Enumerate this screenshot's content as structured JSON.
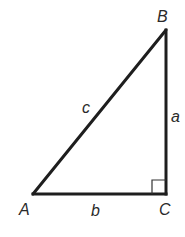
{
  "diagram": {
    "type": "right-triangle",
    "colors": {
      "stroke": "#1e1e1e",
      "label": "#2a2a2a",
      "background": "#ffffff"
    },
    "vertices": {
      "A": {
        "label": "A",
        "x": 33,
        "y": 194
      },
      "B": {
        "label": "B",
        "x": 166,
        "y": 30
      },
      "C": {
        "label": "C",
        "x": 166,
        "y": 194
      }
    },
    "sides": {
      "a": {
        "label": "a",
        "from": "B",
        "to": "C"
      },
      "b": {
        "label": "b",
        "from": "A",
        "to": "C"
      },
      "c": {
        "label": "c",
        "from": "A",
        "to": "B"
      }
    },
    "right_angle_marker": {
      "at": "C",
      "size": 14
    }
  }
}
